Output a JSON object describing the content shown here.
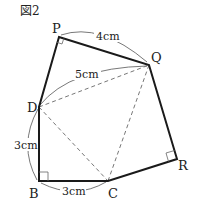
{
  "figure": {
    "title": "図2",
    "points": {
      "P": {
        "label": "P",
        "x": 59,
        "y": 37
      },
      "Q": {
        "label": "Q",
        "x": 149,
        "y": 65
      },
      "D": {
        "label": "D",
        "x": 39,
        "y": 107
      },
      "B": {
        "label": "B",
        "x": 39,
        "y": 181
      },
      "C": {
        "label": "C",
        "x": 108,
        "y": 181
      },
      "R": {
        "label": "R",
        "x": 177,
        "y": 159
      }
    },
    "measurements": {
      "PQ": "4cm",
      "DQ": "5cm",
      "DB": "3cm",
      "BC": "3cm"
    },
    "right_angles": [
      "P",
      "B",
      "R"
    ],
    "solid_edges": [
      "P-Q",
      "Q-R",
      "R-C",
      "C-B",
      "B-D",
      "D-P"
    ],
    "dashed_edges": [
      "D-Q",
      "D-C",
      "Q-C"
    ]
  }
}
